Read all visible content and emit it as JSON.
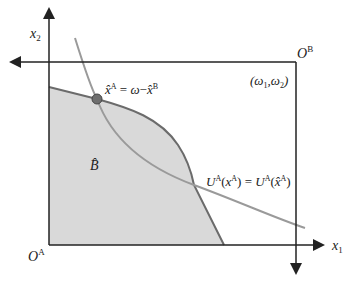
{
  "diagram": {
    "type": "edgeworth-box",
    "labels": {
      "y_axis": "x",
      "y_axis_sub": "2",
      "x_axis": "x",
      "x_axis_sub": "1",
      "origin_a": "O",
      "origin_a_sup": "A",
      "origin_b": "O",
      "origin_b_sup": "B",
      "endowment": "(ω₁,ω₂)",
      "point_label": "x̂ᴬ = ω − x̂ᴮ",
      "budget_set": "B̂",
      "indifference": "Uᴬ(xᴬ) = Uᴬ(x̂ᴬ)"
    },
    "colors": {
      "axis": "#222222",
      "shade": "#d9d9d9",
      "boundary": "#6b6b6b",
      "indifference": "#9a9a9a",
      "point": "#6e6e6e"
    }
  }
}
